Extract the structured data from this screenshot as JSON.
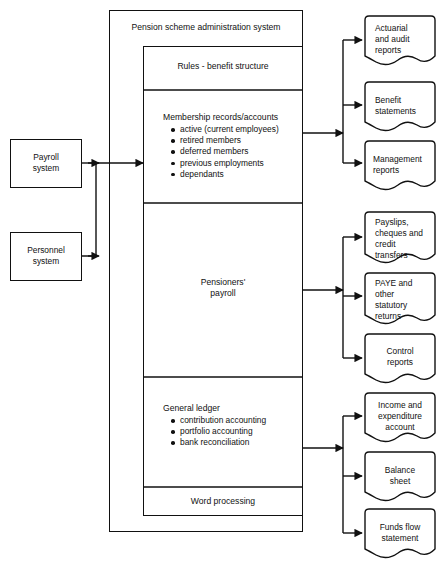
{
  "diagram": {
    "title": "Pension scheme administration system",
    "inputs": [
      {
        "label": "Payroll\nsystem",
        "name": "payroll-system"
      },
      {
        "label": "Personnel\nsystem",
        "name": "personnel-system"
      }
    ],
    "sections": [
      {
        "name": "rules-benefit-structure",
        "heading": "Rules - benefit structure",
        "align": "center",
        "bullets": []
      },
      {
        "name": "membership-records-accounts",
        "heading": "Membership records/accounts",
        "align": "left",
        "bullets": [
          "active (current employees)",
          "retired members",
          "deferred members",
          "previous employments",
          "dependants"
        ]
      },
      {
        "name": "pensioners-payroll",
        "heading": "Pensioners'\npayroll",
        "align": "center",
        "bullets": []
      },
      {
        "name": "general-ledger",
        "heading": "General ledger",
        "align": "left",
        "bullets": [
          "contribution accounting",
          "portfolio accounting",
          "bank reconciliation"
        ]
      },
      {
        "name": "word-processing",
        "heading": "Word processing",
        "align": "center",
        "bullets": []
      }
    ],
    "outputs": [
      {
        "label": "Actuarial\nand audit\nreports",
        "name": "actuarial-and-audit-reports",
        "align": "left"
      },
      {
        "label": "Benefit\nstatements",
        "name": "benefit-statements",
        "align": "left"
      },
      {
        "label": "Management\nreports",
        "name": "management-reports",
        "align": "left"
      },
      {
        "label": "Payslips,\ncheques and\ncredit\ntransfers",
        "name": "payslips-cheques-and-credit-transfers",
        "align": "left"
      },
      {
        "label": "PAYE and\nother\nstatutory\nreturns",
        "name": "paye-and-other-statutory-returns",
        "align": "left"
      },
      {
        "label": "Control\nreports",
        "name": "control-reports",
        "align": "center"
      },
      {
        "label": "Income and\nexpenditure\naccount",
        "name": "income-and-expenditure-account",
        "align": "center"
      },
      {
        "label": "Balance\nsheet",
        "name": "balance-sheet",
        "align": "center"
      },
      {
        "label": "Funds flow\nstatement",
        "name": "funds-flow-statement",
        "align": "center"
      }
    ],
    "colors": {
      "line": "#111111",
      "background": "#ffffff",
      "text": "#111111"
    }
  }
}
